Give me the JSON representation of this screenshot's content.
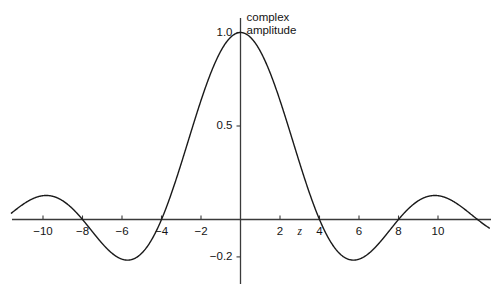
{
  "chart_data": {
    "type": "line",
    "title": "",
    "subtitle": "",
    "xlabel": "z",
    "ylabel": "",
    "annotations": [
      {
        "name": "series-label",
        "text": "complex\namplitude",
        "x": 0.55,
        "y": 1.02
      }
    ],
    "grid": false,
    "legend": "none",
    "xlim": [
      -11.6,
      12.6
    ],
    "ylim": [
      -0.27,
      1.06
    ],
    "xticks": [
      -10,
      -8,
      -6,
      -4,
      -2,
      2,
      4,
      6,
      8,
      10
    ],
    "xtick_labels": [
      "−10",
      "−8",
      "−6",
      "−4",
      "−2",
      "2",
      "4",
      "6",
      "8",
      "10"
    ],
    "yticks": [
      1.0,
      0.5,
      -0.2
    ],
    "ytick_labels": [
      "1.0",
      "0.5",
      "−0.2"
    ],
    "series": [
      {
        "name": "complex amplitude",
        "formula": "sinc(pi*z/4)",
        "color": "#1a1a1a",
        "line_width": 1.4,
        "x": [
          -11.6,
          -11.2,
          -10.8,
          -10.4,
          -10.0,
          -9.6,
          -9.2,
          -8.8,
          -8.4,
          -8.0,
          -7.6,
          -7.2,
          -6.8,
          -6.4,
          -6.0,
          -5.6,
          -5.2,
          -4.8,
          -4.4,
          -4.0,
          -3.6,
          -3.2,
          -2.8,
          -2.4,
          -2.0,
          -1.6,
          -1.2,
          -0.8,
          -0.4,
          0.0,
          0.4,
          0.8,
          1.2,
          1.6,
          2.0,
          2.4,
          2.8,
          3.2,
          3.6,
          4.0,
          4.4,
          4.8,
          5.2,
          5.6,
          6.0,
          6.4,
          6.8,
          7.2,
          7.6,
          8.0,
          8.4,
          8.8,
          9.2,
          9.6,
          10.0,
          10.4,
          10.8,
          11.2,
          11.6,
          12.0,
          12.6
        ],
        "y": [
          -0.0171,
          -0.05,
          -0.0665,
          -0.0632,
          -0.0424,
          -0.0112,
          0.0206,
          0.0432,
          0.0509,
          0.043,
          0.024,
          0.0018,
          -0.0161,
          -0.0249,
          -0.0241,
          -0.0177,
          -0.0135,
          -0.0245,
          -0.0632,
          -0.1351,
          -0.2349,
          -0.344,
          -0.4339,
          -0.4755,
          -0.4502,
          -0.3582,
          -0.2217,
          -0.0801,
          0.0161,
          0.0,
          -0.135,
          -0.36,
          -0.62,
          -0.84,
          -0.97,
          -1.0,
          -0.95,
          -0.82,
          -0.64,
          -0.43,
          -0.22,
          -0.04,
          0.08,
          0.13,
          0.12,
          0.07,
          0.01,
          -0.04,
          -0.06,
          -0.06,
          -0.03,
          0.0,
          0.03,
          0.05,
          0.05,
          0.03,
          0.0,
          -0.03,
          -0.04,
          -0.04,
          -0.02
        ],
        "description": "sinc lobe pattern: main lobe peak 1.0 at z=0, zero crossings at z=±4 and ±8, first side-lobe minima ≈ −0.21 near z=±5.2, second side-lobe maxima ≈ +0.07 near z=±8.6, third lobe minima ≈ −0.05 near z=±11.5",
        "key_points": {
          "peak": {
            "z": 0,
            "value": 1.0
          },
          "zeros": [
            -12,
            -8,
            -4,
            4,
            8,
            12
          ],
          "side_lobe_minima": [
            {
              "z": -5.3,
              "value": -0.21
            },
            {
              "z": 5.3,
              "value": -0.21
            }
          ],
          "side_lobe_maxima": [
            {
              "z": -8.6,
              "value": 0.07
            },
            {
              "z": 8.6,
              "value": 0.07
            }
          ]
        }
      }
    ],
    "axes": {
      "x_axis_visible": true,
      "y_axis_visible": true,
      "axis_color": "#3a3a3a",
      "background": "#ffffff"
    }
  }
}
